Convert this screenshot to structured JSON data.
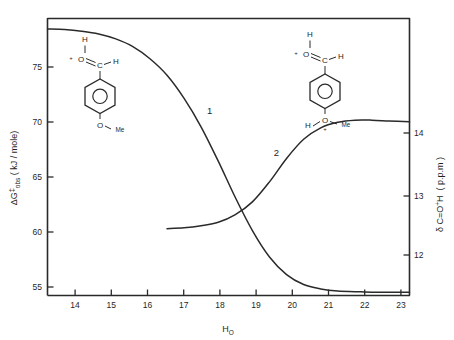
{
  "chart_data": {
    "type": "line",
    "title": "",
    "xlabel": "H_O",
    "xlabel_base": "H",
    "xlabel_sub": "O",
    "xlim": [
      13.3,
      23.9
    ],
    "xticks": [
      14,
      15,
      16,
      17,
      18,
      19,
      20,
      21,
      22,
      23
    ],
    "xtick_labels": [
      "14",
      "15",
      "16",
      "17",
      "18",
      "19",
      "20",
      "21",
      "22",
      "23"
    ],
    "grid": false,
    "legend": "none",
    "left_axis": {
      "label": "ΔG‡obs ( kJ / mole)",
      "label_parts": {
        "delta": "ΔG",
        "dagger": "‡",
        "sub": "obs",
        "units": "( kJ / mole)"
      },
      "ylim": [
        54.1,
        79.3
      ],
      "yticks": [
        55,
        60,
        65,
        70,
        75
      ],
      "ytick_labels": [
        "55",
        "60",
        "65",
        "70",
        "75"
      ]
    },
    "right_axis": {
      "label": "δ C=O⁺H ( p.p.m )",
      "label_parts": {
        "delta": "δ",
        "species": "C=O",
        "charge": "+",
        "h": "H",
        "units": "( p.p.m )"
      },
      "ylim": [
        9.78,
        16.3
      ],
      "yticks": [
        12,
        13,
        14
      ],
      "ytick_labels": [
        "12",
        "13",
        "14"
      ]
    },
    "series": [
      {
        "name": "1",
        "label": "1",
        "axis": "left",
        "units": "kJ/mole",
        "description": "Free energy of activation decreasing sigmoidally with acidity",
        "x": [
          13.3,
          13.8,
          14.3,
          14.8,
          15.3,
          15.8,
          16.3,
          16.8,
          17.3,
          17.8,
          18.3,
          18.8,
          19.3,
          19.8,
          20.3,
          20.8,
          21.3,
          21.8,
          22.3,
          22.8,
          23.3,
          23.9
        ],
        "y": [
          78.3,
          78.25,
          78.1,
          77.85,
          77.4,
          76.7,
          75.6,
          74.1,
          72.0,
          69.4,
          66.3,
          63.0,
          60.0,
          57.6,
          56.0,
          55.1,
          54.7,
          54.5,
          54.45,
          54.4,
          54.4,
          54.4
        ]
      },
      {
        "name": "2",
        "label": "2",
        "axis": "right",
        "units": "p.p.m",
        "description": "Carbonyl proton chemical shift increasing sigmoidally with acidity",
        "x": [
          16.8,
          17.3,
          17.8,
          18.3,
          18.8,
          19.3,
          19.8,
          20.3,
          20.8,
          21.3,
          21.8,
          22.3,
          22.8,
          23.3,
          23.9
        ],
        "y": [
          11.35,
          11.37,
          11.42,
          11.5,
          11.68,
          11.98,
          12.45,
          13.0,
          13.45,
          13.72,
          13.85,
          13.9,
          13.9,
          13.88,
          13.86
        ]
      }
    ],
    "curve_labels": [
      {
        "text": "1",
        "x": 18.05,
        "y_left": 70.6
      },
      {
        "text": "2",
        "x": 20.0,
        "y_right": 13.05
      }
    ],
    "annotations": {
      "structure_left": {
        "name": "protonated-4-methoxybenzaldehyde",
        "top_h": "H",
        "plus": "+",
        "o": "O",
        "c": "C",
        "h_right": "H",
        "bottom_o": "O",
        "me": "Me"
      },
      "structure_right": {
        "name": "diprotonated-4-methoxybenzaldehyde",
        "top_h": "H",
        "plus": "+",
        "o": "O",
        "c": "C",
        "h_right": "H",
        "bottom_h": "H",
        "bottom_o": "O",
        "bottom_plus": "+",
        "me": "Me"
      }
    },
    "colors": {
      "ink": "#2a2a2a",
      "background": "#ffffff"
    }
  }
}
